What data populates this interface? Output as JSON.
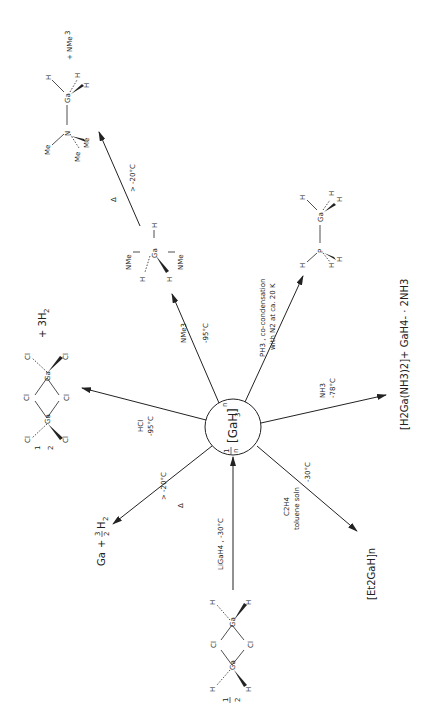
{
  "center": {
    "label": "1/n [GaH3]n",
    "prefix": "1",
    "den": "n",
    "formula": "[GaH",
    "sub": "3",
    "close": "]",
    "subn": "n"
  },
  "reactions": [
    {
      "id": "ga-decomp",
      "conditions": [
        "Δ",
        "> -20°C"
      ],
      "product": "Ga + 3/2 H2",
      "p_ga": "Ga",
      "p_plus": "+",
      "p_num": "3",
      "p_den": "2",
      "p_h": "H",
      "p_sub": "2"
    },
    {
      "id": "hcl",
      "conditions": [
        "HCl",
        "-95°C"
      ],
      "product": "1/2 Ga2Cl6 + 3H2",
      "plus": "+ 3H",
      "sub": "2",
      "half_num": "1",
      "half_den": "2",
      "atoms": {
        "ga": "Ga",
        "cl": "Cl"
      }
    },
    {
      "id": "nme3",
      "conditions": [
        "NMe3",
        "-95°C"
      ],
      "product": "H3Ga(NMe3)2",
      "atoms": {
        "ga": "Ga",
        "h": "H",
        "nme3": "NMe",
        "sub": "3"
      }
    },
    {
      "id": "nme3-decomp",
      "conditions": [
        "Δ",
        "> -20°C"
      ],
      "product": "Me3N–GaH3 + NMe3",
      "atoms": {
        "n": "N",
        "me": "Me",
        "ga": "Ga",
        "h": "H",
        "plus": "+ NMe",
        "sub": "3"
      }
    },
    {
      "id": "ph3",
      "conditions": [
        "PH3 , co-condensation",
        "with N2 at ca. 20 K"
      ],
      "product": "H3P–GaH3",
      "atoms": {
        "p": "P",
        "ga": "Ga",
        "h": "H"
      }
    },
    {
      "id": "nh3",
      "conditions": [
        "NH3",
        "-78°C"
      ],
      "product": "[H2Ga(NH3)2]+ GaH4- · 2NH3"
    },
    {
      "id": "c2h4",
      "conditions": [
        "C2H4",
        "toluene soln",
        "-30°C"
      ],
      "product": "[Et2GaH]n"
    },
    {
      "id": "ligah4",
      "conditions": [
        "LiGaH4 , -30°C"
      ],
      "product": "1/2 [H2GaCl]2",
      "atoms": {
        "ga": "Ga",
        "cl": "Cl",
        "h": "H"
      },
      "half_num": "1",
      "half_den": "2"
    }
  ]
}
